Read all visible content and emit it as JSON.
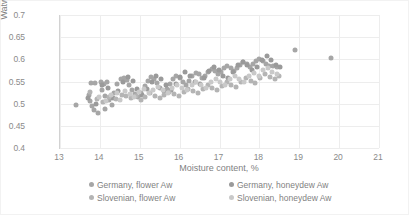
{
  "chart_data": {
    "type": "scatter",
    "title": "",
    "xlabel": "Moisture content, %",
    "ylabel": "Watwe activity",
    "xlim": [
      13,
      21
    ],
    "ylim": [
      0.4,
      0.7
    ],
    "xticks": [
      "13",
      "14",
      "15",
      "16",
      "17",
      "18",
      "19",
      "20",
      "21"
    ],
    "yticks": [
      "0.4",
      "0.45",
      "0.5",
      "0.55",
      "0.6",
      "0.65",
      "0.7"
    ],
    "xtick_values": [
      13,
      14,
      15,
      16,
      17,
      18,
      19,
      20,
      21
    ],
    "ytick_values": [
      0.4,
      0.45,
      0.5,
      0.55,
      0.6,
      0.65,
      0.7
    ],
    "grid": true,
    "grid_axis": "both",
    "legend_position": "bottom",
    "legend_columns": 2,
    "marker_size_px": 5,
    "series": [
      {
        "name": "Germany,  flower Aw",
        "color": "#a6a6a6",
        "points": [
          [
            13.4,
            0.496
          ],
          [
            13.72,
            0.52
          ],
          [
            13.74,
            0.505
          ],
          [
            13.8,
            0.494
          ],
          [
            13.86,
            0.486
          ],
          [
            13.95,
            0.479
          ],
          [
            13.78,
            0.547
          ],
          [
            13.88,
            0.546
          ],
          [
            14.02,
            0.548
          ],
          [
            14.1,
            0.545
          ],
          [
            14.18,
            0.549
          ],
          [
            14.06,
            0.531
          ],
          [
            14.14,
            0.518
          ],
          [
            14.22,
            0.509
          ],
          [
            14.12,
            0.489
          ],
          [
            14.3,
            0.497
          ],
          [
            14.36,
            0.523
          ],
          [
            14.44,
            0.544
          ],
          [
            14.52,
            0.556
          ],
          [
            14.6,
            0.558
          ],
          [
            14.68,
            0.553
          ],
          [
            14.74,
            0.543
          ],
          [
            14.8,
            0.53
          ],
          [
            14.88,
            0.521
          ],
          [
            14.96,
            0.514
          ],
          [
            15.04,
            0.525
          ],
          [
            15.12,
            0.539
          ],
          [
            15.2,
            0.551
          ],
          [
            15.28,
            0.56
          ],
          [
            15.36,
            0.556
          ],
          [
            15.44,
            0.547
          ],
          [
            15.52,
            0.536
          ],
          [
            15.6,
            0.528
          ],
          [
            15.68,
            0.534
          ],
          [
            15.76,
            0.545
          ],
          [
            15.84,
            0.556
          ],
          [
            15.92,
            0.563
          ],
          [
            16.0,
            0.558
          ],
          [
            16.08,
            0.549
          ],
          [
            16.16,
            0.541
          ],
          [
            16.24,
            0.552
          ],
          [
            16.32,
            0.562
          ],
          [
            16.4,
            0.57
          ],
          [
            16.48,
            0.566
          ],
          [
            16.56,
            0.557
          ],
          [
            16.64,
            0.563
          ],
          [
            16.72,
            0.572
          ],
          [
            16.8,
            0.578
          ],
          [
            16.88,
            0.574
          ],
          [
            16.96,
            0.566
          ],
          [
            17.04,
            0.571
          ],
          [
            17.12,
            0.58
          ],
          [
            17.2,
            0.585
          ],
          [
            17.28,
            0.581
          ],
          [
            17.36,
            0.574
          ],
          [
            17.44,
            0.58
          ],
          [
            17.52,
            0.588
          ],
          [
            17.6,
            0.594
          ],
          [
            17.68,
            0.59
          ],
          [
            17.76,
            0.583
          ],
          [
            17.84,
            0.589
          ],
          [
            17.92,
            0.596
          ],
          [
            18.0,
            0.601
          ],
          [
            18.08,
            0.596
          ],
          [
            18.16,
            0.589
          ],
          [
            18.24,
            0.586
          ],
          [
            18.34,
            0.584
          ],
          [
            18.44,
            0.582
          ],
          [
            18.9,
            0.621
          ],
          [
            19.8,
            0.603
          ]
        ]
      },
      {
        "name": "Germany,  honeydew Aw",
        "color": "#9a9a9a",
        "points": [
          [
            13.7,
            0.512
          ],
          [
            13.9,
            0.5
          ],
          [
            14.05,
            0.542
          ],
          [
            14.2,
            0.536
          ],
          [
            14.32,
            0.513
          ],
          [
            14.46,
            0.528
          ],
          [
            14.58,
            0.548
          ],
          [
            14.7,
            0.561
          ],
          [
            14.82,
            0.552
          ],
          [
            14.94,
            0.534
          ],
          [
            15.06,
            0.52
          ],
          [
            15.18,
            0.533
          ],
          [
            15.3,
            0.549
          ],
          [
            15.42,
            0.563
          ],
          [
            15.54,
            0.555
          ],
          [
            15.66,
            0.541
          ],
          [
            15.78,
            0.53
          ],
          [
            15.9,
            0.544
          ],
          [
            16.02,
            0.561
          ],
          [
            16.14,
            0.571
          ],
          [
            16.26,
            0.563
          ],
          [
            16.38,
            0.55
          ],
          [
            16.5,
            0.544
          ],
          [
            16.62,
            0.558
          ],
          [
            16.74,
            0.574
          ],
          [
            16.86,
            0.583
          ],
          [
            16.98,
            0.576
          ],
          [
            17.1,
            0.563
          ],
          [
            17.22,
            0.558
          ],
          [
            17.34,
            0.572
          ],
          [
            17.46,
            0.587
          ],
          [
            17.58,
            0.595
          ],
          [
            17.7,
            0.588
          ],
          [
            17.82,
            0.576
          ],
          [
            17.94,
            0.582
          ],
          [
            18.06,
            0.598
          ],
          [
            18.18,
            0.607
          ],
          [
            18.3,
            0.598
          ],
          [
            18.42,
            0.588
          ],
          [
            18.52,
            0.583
          ]
        ]
      },
      {
        "name": "Slovenian, flower Aw",
        "color": "#b4b4b4",
        "points": [
          [
            13.75,
            0.527
          ],
          [
            13.92,
            0.51
          ],
          [
            14.08,
            0.504
          ],
          [
            14.24,
            0.515
          ],
          [
            14.4,
            0.511
          ],
          [
            14.55,
            0.52
          ],
          [
            14.66,
            0.517
          ],
          [
            14.78,
            0.512
          ],
          [
            14.9,
            0.518
          ],
          [
            15.02,
            0.509
          ],
          [
            15.14,
            0.516
          ],
          [
            15.26,
            0.523
          ],
          [
            15.38,
            0.518
          ],
          [
            15.5,
            0.512
          ],
          [
            15.62,
            0.52
          ],
          [
            15.74,
            0.527
          ],
          [
            15.86,
            0.522
          ],
          [
            15.98,
            0.517
          ],
          [
            16.1,
            0.526
          ],
          [
            16.22,
            0.534
          ],
          [
            16.34,
            0.529
          ],
          [
            16.46,
            0.523
          ],
          [
            16.58,
            0.532
          ],
          [
            16.7,
            0.541
          ],
          [
            16.82,
            0.536
          ],
          [
            16.94,
            0.53
          ],
          [
            17.06,
            0.539
          ],
          [
            17.18,
            0.548
          ],
          [
            17.3,
            0.543
          ],
          [
            17.42,
            0.538
          ],
          [
            17.54,
            0.548
          ],
          [
            17.66,
            0.557
          ],
          [
            17.78,
            0.552
          ],
          [
            17.9,
            0.547
          ],
          [
            18.02,
            0.557
          ],
          [
            18.14,
            0.566
          ],
          [
            18.26,
            0.561
          ],
          [
            18.38,
            0.556
          ],
          [
            18.48,
            0.562
          ]
        ]
      },
      {
        "name": "Slovenian, honeydew Aw",
        "color": "#c9c9c9",
        "points": [
          [
            13.98,
            0.516
          ],
          [
            14.16,
            0.507
          ],
          [
            14.28,
            0.519
          ],
          [
            14.42,
            0.525
          ],
          [
            14.5,
            0.508
          ],
          [
            14.62,
            0.529
          ],
          [
            14.76,
            0.522
          ],
          [
            14.86,
            0.515
          ],
          [
            14.98,
            0.527
          ],
          [
            15.1,
            0.532
          ],
          [
            15.22,
            0.524
          ],
          [
            15.34,
            0.53
          ],
          [
            15.46,
            0.538
          ],
          [
            15.58,
            0.531
          ],
          [
            15.7,
            0.524
          ],
          [
            15.82,
            0.536
          ],
          [
            15.94,
            0.542
          ],
          [
            16.06,
            0.536
          ],
          [
            16.18,
            0.53
          ],
          [
            16.3,
            0.543
          ],
          [
            16.42,
            0.55
          ],
          [
            16.54,
            0.542
          ],
          [
            16.66,
            0.536
          ],
          [
            16.78,
            0.549
          ],
          [
            16.9,
            0.556
          ],
          [
            17.02,
            0.549
          ],
          [
            17.14,
            0.543
          ],
          [
            17.26,
            0.555
          ],
          [
            17.38,
            0.562
          ],
          [
            17.5,
            0.556
          ],
          [
            17.62,
            0.55
          ],
          [
            17.74,
            0.562
          ],
          [
            17.86,
            0.569
          ],
          [
            17.98,
            0.563
          ],
          [
            18.1,
            0.575
          ],
          [
            18.22,
            0.581
          ],
          [
            18.32,
            0.572
          ],
          [
            18.44,
            0.566
          ]
        ]
      }
    ]
  },
  "legend": {
    "items": [
      {
        "label": "Germany,  flower Aw"
      },
      {
        "label": "Germany,  honeydew Aw"
      },
      {
        "label": "Slovenian, flower Aw"
      },
      {
        "label": "Slovenian, honeydew Aw"
      }
    ]
  }
}
